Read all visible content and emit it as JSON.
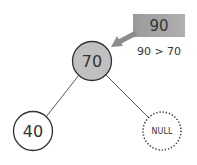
{
  "diagram": {
    "insert_value": {
      "label": "90",
      "box_color": "#a6a6a6"
    },
    "comparison": {
      "label": "90 > 70"
    },
    "arrow": {
      "color": "#8c8c8c"
    },
    "nodes": [
      {
        "id": "root",
        "label": "70",
        "fill": "#c0c0c0",
        "style": "solid"
      },
      {
        "id": "left",
        "label": "40",
        "fill": "#ffffff",
        "style": "solid"
      },
      {
        "id": "right",
        "label": "NULL",
        "fill": "#ffffff",
        "style": "dotted"
      }
    ],
    "edges": [
      {
        "from": "root",
        "to": "left"
      },
      {
        "from": "root",
        "to": "right"
      }
    ]
  }
}
